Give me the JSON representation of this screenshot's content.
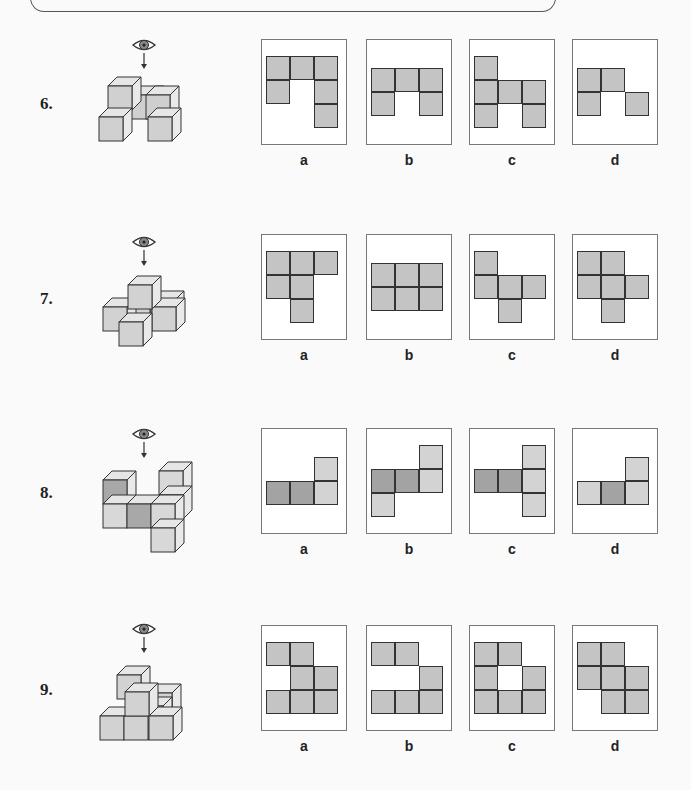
{
  "page": {
    "header_frame": true
  },
  "colors": {
    "cell": "#c4c4c4",
    "cell_dark": "#a3a3a3",
    "cell_light": "#d3d3d3",
    "border": "#333333",
    "box_border": "#777777"
  },
  "questions": [
    {
      "number": "6.",
      "eye_icon": "eye-icon",
      "options": [
        {
          "label": "a",
          "cells": [
            [
              0,
              0
            ],
            [
              1,
              0
            ],
            [
              2,
              0
            ],
            [
              0,
              1
            ],
            [
              2,
              1
            ],
            [
              2,
              2
            ]
          ],
          "off": [
            4,
            16
          ]
        },
        {
          "label": "b",
          "cells": [
            [
              0,
              0
            ],
            [
              1,
              0
            ],
            [
              2,
              0
            ],
            [
              0,
              1
            ],
            [
              2,
              1
            ]
          ],
          "off": [
            4,
            28
          ]
        },
        {
          "label": "c",
          "cells": [
            [
              0,
              0
            ],
            [
              0,
              1
            ],
            [
              1,
              1
            ],
            [
              2,
              1
            ],
            [
              0,
              2
            ],
            [
              2,
              2
            ]
          ],
          "off": [
            4,
            16
          ]
        },
        {
          "label": "d",
          "cells": [
            [
              0,
              0
            ],
            [
              1,
              0
            ],
            [
              0,
              1
            ],
            [
              2,
              1
            ]
          ],
          "off": [
            4,
            28
          ]
        }
      ]
    },
    {
      "number": "7.",
      "eye_icon": "eye-icon",
      "options": [
        {
          "label": "a",
          "cells": [
            [
              0,
              0
            ],
            [
              1,
              0
            ],
            [
              2,
              0
            ],
            [
              0,
              1
            ],
            [
              1,
              1
            ],
            [
              1,
              2
            ]
          ],
          "off": [
            4,
            16
          ]
        },
        {
          "label": "b",
          "cells": [
            [
              0,
              0
            ],
            [
              1,
              0
            ],
            [
              2,
              0
            ],
            [
              0,
              1
            ],
            [
              1,
              1
            ],
            [
              2,
              1
            ]
          ],
          "off": [
            4,
            28
          ]
        },
        {
          "label": "c",
          "cells": [
            [
              0,
              0
            ],
            [
              0,
              1
            ],
            [
              1,
              1
            ],
            [
              2,
              1
            ],
            [
              1,
              2
            ]
          ],
          "off": [
            4,
            16
          ]
        },
        {
          "label": "d",
          "cells": [
            [
              0,
              0
            ],
            [
              1,
              0
            ],
            [
              0,
              1
            ],
            [
              1,
              1
            ],
            [
              2,
              1
            ],
            [
              1,
              2
            ]
          ],
          "off": [
            4,
            16
          ]
        }
      ]
    },
    {
      "number": "8.",
      "eye_icon": "eye-icon",
      "options": [
        {
          "label": "a",
          "cells": [
            [
              2,
              0,
              "light"
            ],
            [
              0,
              1,
              "dark"
            ],
            [
              1,
              1,
              "dark"
            ],
            [
              2,
              1,
              "light"
            ]
          ],
          "off": [
            4,
            28
          ]
        },
        {
          "label": "b",
          "cells": [
            [
              2,
              0,
              "light"
            ],
            [
              0,
              1,
              "dark"
            ],
            [
              1,
              1,
              "dark"
            ],
            [
              2,
              1,
              "light"
            ],
            [
              0,
              2,
              "light"
            ]
          ],
          "off": [
            4,
            16
          ]
        },
        {
          "label": "c",
          "cells": [
            [
              2,
              0,
              "light"
            ],
            [
              0,
              1,
              "dark"
            ],
            [
              1,
              1,
              "dark"
            ],
            [
              2,
              1,
              "light"
            ],
            [
              2,
              2,
              "light"
            ]
          ],
          "off": [
            4,
            16
          ]
        },
        {
          "label": "d",
          "cells": [
            [
              2,
              0,
              "light"
            ],
            [
              0,
              1,
              "light"
            ],
            [
              1,
              1,
              "dark"
            ],
            [
              2,
              1,
              "light"
            ]
          ],
          "off": [
            4,
            28
          ]
        }
      ]
    },
    {
      "number": "9.",
      "eye_icon": "eye-icon",
      "options": [
        {
          "label": "a",
          "cells": [
            [
              0,
              0
            ],
            [
              1,
              0
            ],
            [
              1,
              1
            ],
            [
              2,
              1
            ],
            [
              0,
              2
            ],
            [
              1,
              2
            ],
            [
              2,
              2
            ]
          ],
          "off": [
            4,
            16
          ]
        },
        {
          "label": "b",
          "cells": [
            [
              0,
              0
            ],
            [
              1,
              0
            ],
            [
              2,
              1
            ],
            [
              0,
              2
            ],
            [
              1,
              2
            ],
            [
              2,
              2
            ]
          ],
          "off": [
            4,
            16
          ]
        },
        {
          "label": "c",
          "cells": [
            [
              0,
              0
            ],
            [
              1,
              0
            ],
            [
              0,
              1
            ],
            [
              2,
              1
            ],
            [
              0,
              2
            ],
            [
              1,
              2
            ],
            [
              2,
              2
            ]
          ],
          "off": [
            4,
            16
          ]
        },
        {
          "label": "d",
          "cells": [
            [
              0,
              0
            ],
            [
              1,
              0
            ],
            [
              0,
              1
            ],
            [
              1,
              1
            ],
            [
              2,
              1
            ],
            [
              1,
              2
            ],
            [
              2,
              2
            ]
          ],
          "off": [
            4,
            16
          ]
        }
      ]
    }
  ]
}
